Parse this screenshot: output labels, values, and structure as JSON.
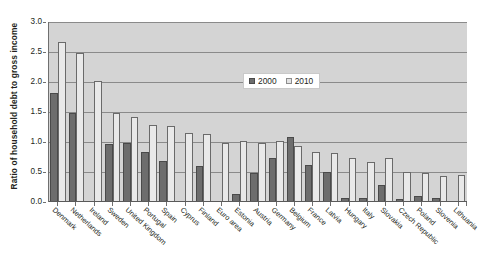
{
  "chart_data": {
    "type": "bar",
    "title": "",
    "xlabel": "",
    "ylabel": "Ratio of household debt to gross income",
    "ylim": [
      0.0,
      3.0
    ],
    "yticks": [
      "0.0",
      "0.5",
      "1.0",
      "1.5",
      "2.0",
      "2.5",
      "3.0"
    ],
    "ytick_values": [
      0.0,
      0.5,
      1.0,
      1.5,
      2.0,
      2.5,
      3.0
    ],
    "grid": true,
    "legend_position": "top-center-right",
    "categories": [
      "Denmark",
      "Netherlands",
      "Ireland",
      "Sweden",
      "United Kingdom",
      "Portugal",
      "Spain",
      "Cyprus",
      "Finland",
      "Euro area",
      "Estonia",
      "Austria",
      "Germany",
      "Belgium",
      "France",
      "Latvia",
      "Hungary",
      "Italy",
      "Slovakia",
      "Czech Republic",
      "Poland",
      "Slovenia",
      "Lithuania"
    ],
    "series": [
      {
        "name": "2000",
        "color": "#6d6d6d",
        "values": [
          1.82,
          1.49,
          0.0,
          0.96,
          0.99,
          0.83,
          0.68,
          0.0,
          0.6,
          0.0,
          0.14,
          0.49,
          0.74,
          1.08,
          0.62,
          0.5,
          0.07,
          0.07,
          0.29,
          0.05,
          0.1,
          0.06,
          0.0
        ]
      },
      {
        "name": "2010",
        "color": "#e9e9e9",
        "values": [
          2.67,
          2.48,
          2.02,
          1.48,
          1.42,
          1.29,
          1.26,
          1.15,
          1.13,
          0.99,
          1.02,
          0.98,
          1.02,
          0.94,
          0.84,
          0.82,
          0.74,
          0.67,
          0.73,
          0.5,
          0.48,
          0.44,
          0.45
        ]
      }
    ]
  },
  "legend": {
    "items": [
      {
        "label": "2000"
      },
      {
        "label": "2010"
      }
    ]
  }
}
